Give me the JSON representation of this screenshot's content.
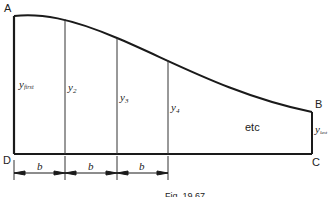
{
  "figure": {
    "caption": "Fig. 19.67",
    "points": {
      "A": "A",
      "B": "B",
      "C": "C",
      "D": "D"
    },
    "ordinates": [
      {
        "base": "y",
        "sub": "first"
      },
      {
        "base": "y",
        "sub": "2"
      },
      {
        "base": "y",
        "sub": "3"
      },
      {
        "base": "y",
        "sub": "4"
      },
      {
        "base": "y",
        "sub": "last"
      }
    ],
    "continuation_label": "etc",
    "spacing_label": "b",
    "spacings": [
      "b",
      "b",
      "b"
    ],
    "colors": {
      "stroke": "#1a1a1a",
      "text": "#222222",
      "background": "#ffffff"
    }
  }
}
